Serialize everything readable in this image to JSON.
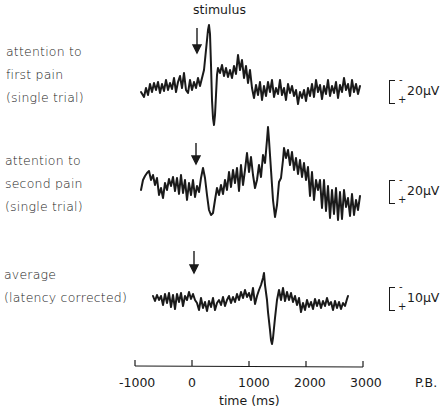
{
  "chart_data": {
    "type": "line",
    "title": "",
    "annotation_stimulus": "stimulus",
    "xlabel": "time (ms)",
    "x_ticks": [
      "-1000",
      "0",
      "1000",
      "2000",
      "3000"
    ],
    "xlim": [
      -1000,
      3000
    ],
    "credit": "P.B.",
    "polarity_note": "negative up",
    "series": [
      {
        "name": "attention to first pain (single trial)",
        "label_lines": [
          "attention to",
          "first pain",
          "(single trial)"
        ],
        "scale_label": "20μV",
        "stimulus_ms": 0,
        "peaks": [
          {
            "ms": 300,
            "kind": "negative (up)"
          },
          {
            "ms": 380,
            "kind": "positive (down)"
          }
        ],
        "x_range_ms": [
          -900,
          2950
        ]
      },
      {
        "name": "attention to second pain (single trial)",
        "label_lines": [
          "attention to",
          "second pain",
          "(single trial)"
        ],
        "scale_label": "20μV",
        "stimulus_ms": 0,
        "peaks": [
          {
            "ms": 1340,
            "kind": "negative (up)"
          },
          {
            "ms": 1460,
            "kind": "positive (down)"
          }
        ],
        "x_range_ms": [
          -900,
          2950
        ]
      },
      {
        "name": "average (latency corrected)",
        "label_lines": [
          "average",
          "(latency corrected)"
        ],
        "scale_label": "10μV",
        "stimulus_ms": 0,
        "peaks": [
          {
            "ms": 1270,
            "kind": "negative (up)"
          },
          {
            "ms": 1410,
            "kind": "positive (down)"
          }
        ],
        "x_range_ms": [
          -650,
          2700
        ]
      }
    ]
  },
  "labels": {
    "stimulus": "stimulus",
    "trace1": [
      "attention to",
      "first pain",
      "(single trial)"
    ],
    "trace2": [
      "attention to",
      "second pain",
      "(single trial)"
    ],
    "trace3": [
      "average",
      "(latency corrected)"
    ],
    "scale1": "20μV",
    "scale2": "20μV",
    "scale3": "10μV",
    "minus": "-",
    "plus": "+",
    "ticks": [
      "-1000",
      "0",
      "1000",
      "2000",
      "3000"
    ],
    "xlabel": "time (ms)",
    "credit": "P.B."
  },
  "traces": {
    "t1": [
      [
        141,
        92
      ],
      [
        144,
        97
      ],
      [
        146,
        88
      ],
      [
        148,
        95
      ],
      [
        150,
        84
      ],
      [
        152,
        92
      ],
      [
        154,
        83
      ],
      [
        156,
        90
      ],
      [
        158,
        82
      ],
      [
        160,
        93
      ],
      [
        162,
        84
      ],
      [
        164,
        91
      ],
      [
        166,
        80
      ],
      [
        168,
        90
      ],
      [
        170,
        83
      ],
      [
        172,
        89
      ],
      [
        174,
        78
      ],
      [
        176,
        92
      ],
      [
        178,
        82
      ],
      [
        180,
        76
      ],
      [
        182,
        88
      ],
      [
        184,
        73
      ],
      [
        186,
        90
      ],
      [
        188,
        93
      ],
      [
        190,
        80
      ],
      [
        192,
        90
      ],
      [
        194,
        82
      ],
      [
        196,
        88
      ],
      [
        198,
        78
      ],
      [
        200,
        86
      ],
      [
        202,
        78
      ],
      [
        204,
        70
      ],
      [
        206,
        50
      ],
      [
        208,
        30
      ],
      [
        209,
        25
      ],
      [
        210,
        34
      ],
      [
        211,
        65
      ],
      [
        212,
        100
      ],
      [
        213,
        118
      ],
      [
        214,
        125
      ],
      [
        215,
        115
      ],
      [
        216,
        95
      ],
      [
        217,
        75
      ],
      [
        218,
        68
      ],
      [
        220,
        73
      ],
      [
        222,
        65
      ],
      [
        224,
        76
      ],
      [
        226,
        68
      ],
      [
        228,
        77
      ],
      [
        230,
        70
      ],
      [
        232,
        78
      ],
      [
        234,
        66
      ],
      [
        236,
        74
      ],
      [
        238,
        55
      ],
      [
        240,
        70
      ],
      [
        242,
        60
      ],
      [
        244,
        78
      ],
      [
        246,
        66
      ],
      [
        248,
        83
      ],
      [
        250,
        70
      ],
      [
        252,
        88
      ],
      [
        254,
        98
      ],
      [
        256,
        85
      ],
      [
        258,
        95
      ],
      [
        260,
        82
      ],
      [
        262,
        100
      ],
      [
        264,
        86
      ],
      [
        266,
        96
      ],
      [
        268,
        82
      ],
      [
        270,
        92
      ],
      [
        272,
        80
      ],
      [
        274,
        97
      ],
      [
        276,
        88
      ],
      [
        278,
        94
      ],
      [
        280,
        80
      ],
      [
        282,
        95
      ],
      [
        284,
        88
      ],
      [
        286,
        100
      ],
      [
        288,
        84
      ],
      [
        290,
        93
      ],
      [
        292,
        86
      ],
      [
        294,
        96
      ],
      [
        296,
        90
      ],
      [
        298,
        104
      ],
      [
        300,
        92
      ],
      [
        302,
        98
      ],
      [
        304,
        90
      ],
      [
        306,
        101
      ],
      [
        308,
        88
      ],
      [
        310,
        96
      ],
      [
        312,
        84
      ],
      [
        314,
        97
      ],
      [
        316,
        80
      ],
      [
        318,
        92
      ],
      [
        320,
        85
      ],
      [
        322,
        99
      ],
      [
        324,
        86
      ],
      [
        326,
        94
      ],
      [
        328,
        80
      ],
      [
        330,
        96
      ],
      [
        332,
        86
      ],
      [
        334,
        93
      ],
      [
        336,
        82
      ],
      [
        338,
        98
      ],
      [
        340,
        85
      ],
      [
        342,
        92
      ],
      [
        344,
        78
      ],
      [
        346,
        90
      ],
      [
        348,
        84
      ],
      [
        350,
        96
      ],
      [
        352,
        80
      ],
      [
        354,
        92
      ],
      [
        356,
        84
      ],
      [
        358,
        94
      ],
      [
        360,
        86
      ]
    ],
    "t2": [
      [
        141,
        190
      ],
      [
        143,
        180
      ],
      [
        145,
        176
      ],
      [
        147,
        173
      ],
      [
        149,
        171
      ],
      [
        151,
        180
      ],
      [
        153,
        175
      ],
      [
        155,
        185
      ],
      [
        157,
        178
      ],
      [
        159,
        195
      ],
      [
        161,
        188
      ],
      [
        163,
        198
      ],
      [
        165,
        183
      ],
      [
        167,
        190
      ],
      [
        169,
        179
      ],
      [
        171,
        186
      ],
      [
        173,
        177
      ],
      [
        175,
        191
      ],
      [
        177,
        178
      ],
      [
        179,
        194
      ],
      [
        181,
        175
      ],
      [
        183,
        193
      ],
      [
        185,
        180
      ],
      [
        187,
        200
      ],
      [
        189,
        183
      ],
      [
        191,
        195
      ],
      [
        193,
        180
      ],
      [
        195,
        197
      ],
      [
        197,
        186
      ],
      [
        199,
        192
      ],
      [
        201,
        178
      ],
      [
        203,
        168
      ],
      [
        205,
        178
      ],
      [
        207,
        195
      ],
      [
        209,
        210
      ],
      [
        211,
        215
      ],
      [
        213,
        213
      ],
      [
        215,
        200
      ],
      [
        217,
        188
      ],
      [
        219,
        195
      ],
      [
        221,
        185
      ],
      [
        223,
        194
      ],
      [
        225,
        180
      ],
      [
        227,
        190
      ],
      [
        229,
        172
      ],
      [
        231,
        187
      ],
      [
        233,
        170
      ],
      [
        235,
        183
      ],
      [
        237,
        168
      ],
      [
        239,
        191
      ],
      [
        241,
        165
      ],
      [
        243,
        185
      ],
      [
        245,
        170
      ],
      [
        247,
        153
      ],
      [
        249,
        172
      ],
      [
        251,
        157
      ],
      [
        253,
        175
      ],
      [
        255,
        188
      ],
      [
        257,
        180
      ],
      [
        259,
        165
      ],
      [
        261,
        177
      ],
      [
        263,
        155
      ],
      [
        265,
        163
      ],
      [
        267,
        140
      ],
      [
        268,
        127
      ],
      [
        269,
        140
      ],
      [
        271,
        170
      ],
      [
        273,
        200
      ],
      [
        275,
        217
      ],
      [
        277,
        205
      ],
      [
        279,
        182
      ],
      [
        281,
        178
      ],
      [
        283,
        160
      ],
      [
        284,
        148
      ],
      [
        286,
        158
      ],
      [
        288,
        150
      ],
      [
        290,
        165
      ],
      [
        292,
        152
      ],
      [
        294,
        170
      ],
      [
        296,
        158
      ],
      [
        298,
        174
      ],
      [
        300,
        160
      ],
      [
        302,
        177
      ],
      [
        304,
        163
      ],
      [
        306,
        180
      ],
      [
        308,
        167
      ],
      [
        310,
        196
      ],
      [
        312,
        172
      ],
      [
        314,
        200
      ],
      [
        316,
        180
      ],
      [
        318,
        190
      ],
      [
        320,
        180
      ],
      [
        322,
        208
      ],
      [
        324,
        180
      ],
      [
        326,
        211
      ],
      [
        328,
        186
      ],
      [
        330,
        218
      ],
      [
        332,
        190
      ],
      [
        334,
        214
      ],
      [
        336,
        188
      ],
      [
        338,
        220
      ],
      [
        340,
        192
      ],
      [
        342,
        219
      ],
      [
        344,
        190
      ],
      [
        346,
        207
      ],
      [
        348,
        198
      ],
      [
        350,
        216
      ],
      [
        352,
        194
      ],
      [
        354,
        215
      ],
      [
        356,
        200
      ],
      [
        358,
        210
      ],
      [
        360,
        196
      ]
    ],
    "t3": [
      [
        153,
        296
      ],
      [
        155,
        301
      ],
      [
        157,
        295
      ],
      [
        159,
        300
      ],
      [
        161,
        296
      ],
      [
        163,
        305
      ],
      [
        165,
        294
      ],
      [
        167,
        303
      ],
      [
        169,
        293
      ],
      [
        171,
        307
      ],
      [
        173,
        295
      ],
      [
        175,
        309
      ],
      [
        177,
        294
      ],
      [
        179,
        302
      ],
      [
        181,
        293
      ],
      [
        183,
        306
      ],
      [
        185,
        296
      ],
      [
        187,
        300
      ],
      [
        189,
        292
      ],
      [
        191,
        299
      ],
      [
        193,
        294
      ],
      [
        195,
        300
      ],
      [
        197,
        303
      ],
      [
        199,
        310
      ],
      [
        201,
        298
      ],
      [
        203,
        308
      ],
      [
        205,
        302
      ],
      [
        207,
        311
      ],
      [
        209,
        301
      ],
      [
        211,
        307
      ],
      [
        213,
        298
      ],
      [
        215,
        310
      ],
      [
        217,
        303
      ],
      [
        219,
        300
      ],
      [
        221,
        305
      ],
      [
        223,
        297
      ],
      [
        225,
        306
      ],
      [
        227,
        300
      ],
      [
        229,
        296
      ],
      [
        231,
        303
      ],
      [
        233,
        297
      ],
      [
        235,
        302
      ],
      [
        237,
        294
      ],
      [
        239,
        300
      ],
      [
        241,
        292
      ],
      [
        243,
        298
      ],
      [
        245,
        290
      ],
      [
        247,
        297
      ],
      [
        249,
        293
      ],
      [
        251,
        300
      ],
      [
        253,
        288
      ],
      [
        255,
        304
      ],
      [
        257,
        296
      ],
      [
        259,
        290
      ],
      [
        261,
        285
      ],
      [
        263,
        278
      ],
      [
        264,
        273
      ],
      [
        265,
        285
      ],
      [
        267,
        300
      ],
      [
        268,
        312
      ],
      [
        270,
        330
      ],
      [
        271,
        340
      ],
      [
        272,
        344
      ],
      [
        273,
        338
      ],
      [
        275,
        318
      ],
      [
        277,
        300
      ],
      [
        279,
        290
      ],
      [
        281,
        300
      ],
      [
        283,
        288
      ],
      [
        285,
        301
      ],
      [
        287,
        292
      ],
      [
        289,
        300
      ],
      [
        291,
        293
      ],
      [
        293,
        302
      ],
      [
        295,
        296
      ],
      [
        297,
        305
      ],
      [
        299,
        298
      ],
      [
        301,
        312
      ],
      [
        303,
        303
      ],
      [
        305,
        310
      ],
      [
        307,
        300
      ],
      [
        309,
        307
      ],
      [
        311,
        302
      ],
      [
        313,
        309
      ],
      [
        315,
        299
      ],
      [
        317,
        306
      ],
      [
        319,
        300
      ],
      [
        321,
        308
      ],
      [
        323,
        301
      ],
      [
        325,
        306
      ],
      [
        327,
        298
      ],
      [
        329,
        305
      ],
      [
        331,
        302
      ],
      [
        333,
        310
      ],
      [
        335,
        301
      ],
      [
        337,
        308
      ],
      [
        339,
        302
      ],
      [
        341,
        309
      ],
      [
        343,
        303
      ],
      [
        345,
        306
      ],
      [
        347,
        299
      ],
      [
        348,
        296
      ]
    ]
  }
}
